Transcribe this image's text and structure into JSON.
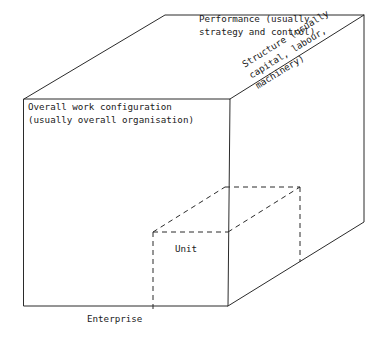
{
  "diagram": {
    "background_color": "#ffffff",
    "line_color": "#2b2b2b",
    "text_color": "#1a1a1a",
    "labels": {
      "performance": "Performance (usually\nstrategy and control)",
      "structure": "Structure (usually\ncapital, labour,\nmachinery)",
      "overall_work": "Overall work configuration\n(usually overall organisation)",
      "unit": "Unit",
      "enterprise": "Enterprise"
    },
    "outer_cube": {
      "style": "solid",
      "front_face": [
        [
          24,
          99
        ],
        [
          230,
          99
        ],
        [
          228,
          306
        ],
        [
          24,
          306
        ]
      ],
      "back_top_left": [
        165,
        15
      ],
      "back_top_right": [
        364,
        15
      ],
      "back_bottom_right": [
        364,
        222
      ]
    },
    "inner_cube": {
      "style": "dashed",
      "front_top_left": [
        153,
        232
      ],
      "front_top_right": [
        228,
        232
      ],
      "front_bottom_left": [
        153,
        306
      ],
      "back_top_left": [
        225,
        187
      ],
      "back_top_right": [
        300,
        187
      ],
      "back_bottom_right": [
        300,
        262
      ]
    }
  }
}
